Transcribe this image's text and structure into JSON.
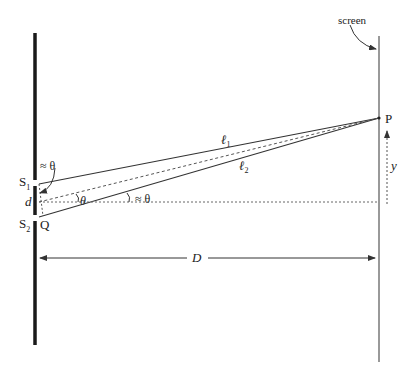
{
  "diagram": {
    "labels": {
      "screen": "screen",
      "S1": "S",
      "S1_sub": "1",
      "S2": "S",
      "S2_sub": "2",
      "d": "d",
      "Q": "Q",
      "P": "P",
      "y": "y",
      "D": "D",
      "l1": "ℓ",
      "l1_sub": "1",
      "l2": "ℓ",
      "l2_sub": "2",
      "theta_small": "θ",
      "theta_approx_axis": "≈ θ",
      "theta_approx_top": "≈ θ"
    },
    "colors": {
      "barrier": "#1a1a1a",
      "screen": "#555555",
      "rays": "#333333",
      "dashed": "#555555",
      "text": "#222222"
    }
  }
}
